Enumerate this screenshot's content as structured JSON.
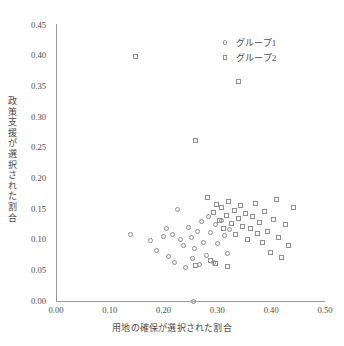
{
  "header_fragments": [
    "",
    "",
    "",
    "",
    "",
    "",
    ""
  ],
  "legend": {
    "position": "top-right",
    "items": [
      {
        "label": "グループ1",
        "marker": "circle-marker-icon"
      },
      {
        "label": "グループ2",
        "marker": "square-marker-icon"
      }
    ]
  },
  "chart_data": {
    "type": "scatter",
    "title": "",
    "xlabel": "用地の確保が選択された割合",
    "ylabel": "政策支援が選択された割合",
    "xlim": [
      0.0,
      0.5
    ],
    "ylim": [
      0.0,
      0.45
    ],
    "xticks": [
      "0.00",
      "0.10",
      "0.20",
      "0.30",
      "0.40",
      "0.50"
    ],
    "xtick_values": [
      0.0,
      0.1,
      0.2,
      0.3,
      0.4,
      0.5
    ],
    "yticks": [
      "0.00",
      "0.05",
      "0.10",
      "0.15",
      "0.20",
      "0.25",
      "0.30",
      "0.35",
      "0.40",
      "0.45"
    ],
    "ytick_values": [
      0.0,
      0.05,
      0.1,
      0.15,
      0.2,
      0.25,
      0.3,
      0.35,
      0.4,
      0.45
    ],
    "grid": false,
    "series": [
      {
        "name": "グループ1",
        "marker": "circle",
        "points": [
          [
            0.255,
            0.0
          ],
          [
            0.138,
            0.108
          ],
          [
            0.176,
            0.098
          ],
          [
            0.186,
            0.083
          ],
          [
            0.199,
            0.105
          ],
          [
            0.205,
            0.118
          ],
          [
            0.21,
            0.073
          ],
          [
            0.216,
            0.108
          ],
          [
            0.221,
            0.063
          ],
          [
            0.226,
            0.149
          ],
          [
            0.232,
            0.1
          ],
          [
            0.237,
            0.091
          ],
          [
            0.24,
            0.055
          ],
          [
            0.247,
            0.12
          ],
          [
            0.251,
            0.104
          ],
          [
            0.254,
            0.069
          ],
          [
            0.258,
            0.086
          ],
          [
            0.263,
            0.113
          ],
          [
            0.266,
            0.059
          ],
          [
            0.271,
            0.129
          ],
          [
            0.274,
            0.096
          ],
          [
            0.279,
            0.075
          ],
          [
            0.283,
            0.138
          ],
          [
            0.288,
            0.111
          ],
          [
            0.292,
            0.062
          ],
          [
            0.296,
            0.124
          ],
          [
            0.301,
            0.093
          ],
          [
            0.307,
            0.132
          ],
          [
            0.313,
            0.106
          ],
          [
            0.318,
            0.078
          ],
          [
            0.323,
            0.116
          ]
        ]
      },
      {
        "name": "グループ2",
        "marker": "square",
        "points": [
          [
            0.148,
            0.398
          ],
          [
            0.34,
            0.358
          ],
          [
            0.26,
            0.262
          ],
          [
            0.281,
            0.168
          ],
          [
            0.292,
            0.145
          ],
          [
            0.298,
            0.158
          ],
          [
            0.303,
            0.131
          ],
          [
            0.308,
            0.152
          ],
          [
            0.312,
            0.119
          ],
          [
            0.317,
            0.14
          ],
          [
            0.321,
            0.163
          ],
          [
            0.326,
            0.127
          ],
          [
            0.331,
            0.148
          ],
          [
            0.334,
            0.108
          ],
          [
            0.339,
            0.135
          ],
          [
            0.343,
            0.156
          ],
          [
            0.347,
            0.122
          ],
          [
            0.352,
            0.142
          ],
          [
            0.356,
            0.101
          ],
          [
            0.361,
            0.118
          ],
          [
            0.365,
            0.137
          ],
          [
            0.37,
            0.159
          ],
          [
            0.374,
            0.11
          ],
          [
            0.379,
            0.128
          ],
          [
            0.383,
            0.095
          ],
          [
            0.388,
            0.146
          ],
          [
            0.393,
            0.114
          ],
          [
            0.398,
            0.079
          ],
          [
            0.404,
            0.133
          ],
          [
            0.409,
            0.165
          ],
          [
            0.414,
            0.104
          ],
          [
            0.42,
            0.071
          ],
          [
            0.426,
            0.125
          ],
          [
            0.433,
            0.091
          ],
          [
            0.441,
            0.152
          ],
          [
            0.259,
            0.058
          ],
          [
            0.287,
            0.066
          ],
          [
            0.296,
            0.061
          ],
          [
            0.318,
            0.057
          ]
        ]
      }
    ]
  }
}
